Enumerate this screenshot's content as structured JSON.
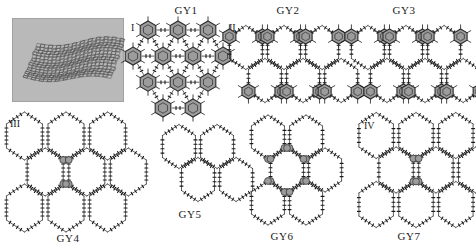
{
  "figure": {
    "background": "#ffffff",
    "ink": "#1a1a1a",
    "node_fill": "#9c9c9c",
    "node_stroke": "#2b2b2b",
    "bar_fill": "#4a4a4a",
    "tem_background": "#b9b9b9"
  },
  "tem_image": {
    "name": "corrugated-graphyne-sheet",
    "x": 12,
    "y": 18,
    "width": 110,
    "height": 82
  },
  "numerals": [
    {
      "label": "I",
      "x": 131,
      "y": 22
    },
    {
      "label": "II",
      "x": 229,
      "y": 22
    },
    {
      "label": "III",
      "x": 10,
      "y": 118
    },
    {
      "label": "IV",
      "x": 364,
      "y": 120
    }
  ],
  "panels": [
    {
      "id": "gy1",
      "caption": "GY1",
      "caption_x": 186,
      "caption_y": 4,
      "x": 128,
      "y": 16,
      "width": 100,
      "height": 96,
      "type": "kagome-triangular",
      "nodes": "gray-hexagon-rings",
      "links": "short-dark-bonds",
      "has_dark_bars": false
    },
    {
      "id": "gy2",
      "caption": "GY2",
      "caption_x": 288,
      "caption_y": 4,
      "x": 232,
      "y": 16,
      "width": 104,
      "height": 96,
      "type": "honeycomb-rows",
      "nodes": "gray-hexagon-rings",
      "links": "chain-bonds",
      "has_dark_bars": true
    },
    {
      "id": "gy3",
      "caption": "GY3",
      "caption_x": 404,
      "caption_y": 4,
      "x": 344,
      "y": 16,
      "width": 124,
      "height": 96,
      "type": "honeycomb-offset",
      "nodes": "gray-hexagon-rings",
      "links": "chain-bonds",
      "has_dark_bars": true
    },
    {
      "id": "gy4",
      "caption": "GY4",
      "caption_x": 68,
      "caption_y": 232,
      "x": 4,
      "y": 116,
      "width": 124,
      "height": 112,
      "type": "expanded-honeycomb",
      "nodes": "gray-circles",
      "links": "chain-bonds",
      "has_dark_bars": true
    },
    {
      "id": "gy5",
      "caption": "GY5",
      "caption_x": 190,
      "caption_y": 208,
      "x": 150,
      "y": 120,
      "width": 96,
      "height": 86,
      "type": "expanded-honeycomb",
      "nodes": "none",
      "links": "chain-bonds",
      "has_dark_bars": true
    },
    {
      "id": "gy6",
      "caption": "GY6",
      "caption_x": 282,
      "caption_y": 230,
      "x": 244,
      "y": 118,
      "width": 86,
      "height": 104,
      "type": "expanded-honeycomb",
      "nodes": "gray-circles",
      "links": "chain-bonds",
      "has_dark_bars": true
    },
    {
      "id": "gy7",
      "caption": "GY7",
      "caption_x": 409,
      "caption_y": 230,
      "x": 360,
      "y": 118,
      "width": 112,
      "height": 104,
      "type": "expanded-honeycomb",
      "nodes": "gray-circles",
      "links": "chain-bonds",
      "has_dark_bars": false
    }
  ]
}
